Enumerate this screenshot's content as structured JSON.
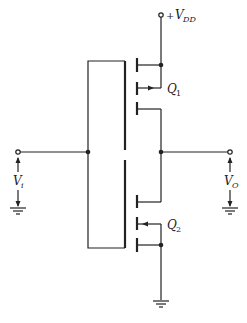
{
  "diagram": {
    "type": "circuit-schematic",
    "labels": {
      "supply_sign": "+",
      "supply": "V",
      "supply_sub": "DD",
      "q1": "Q",
      "q1_sub": "1",
      "q2": "Q",
      "q2_sub": "2",
      "vin": "V",
      "vin_sub": "i",
      "vout": "V",
      "vout_sub": "O"
    },
    "components": [
      {
        "id": "Q1",
        "kind": "MOSFET",
        "position": "top"
      },
      {
        "id": "Q2",
        "kind": "MOSFET",
        "position": "bottom"
      }
    ],
    "terminals": [
      "+VDD",
      "Vi",
      "VO",
      "ground"
    ],
    "colors": {
      "line": "#222222",
      "background": "#ffffff"
    }
  }
}
